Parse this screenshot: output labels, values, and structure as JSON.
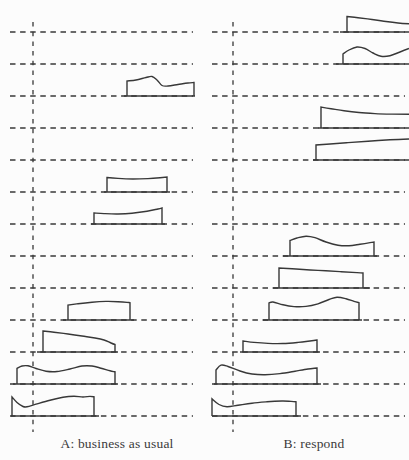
{
  "chart_data": {
    "type": "ridgeline",
    "title": "",
    "layout": {
      "width": 409,
      "height": 460,
      "rows": 13,
      "row_first_y": 32,
      "row_gap": 32,
      "axis_y_top": 22,
      "axis_y_bottom": 432,
      "clip_x": 409,
      "h_dash": "5.5 4.6",
      "v_dash": "4.5 5.2",
      "stroke_width": 1.4
    },
    "colors": {
      "stroke": "#383838",
      "text": "#3a3a3a",
      "background": "#fcfcfc"
    },
    "panels": [
      {
        "id": "A",
        "label": "A: business as usual",
        "x_range": [
          10,
          193
        ],
        "axis_x": 33,
        "shapes": [
          {
            "row": 3,
            "clipped": false,
            "tails": [
              124,
              195
            ],
            "pts": [
              [
                127,
                15
              ],
              [
                136,
                16
              ],
              [
                146,
                18.5
              ],
              [
                152,
                19.5
              ],
              [
                157,
                16
              ],
              [
                162,
                10.5
              ],
              [
                168,
                10
              ],
              [
                178,
                11.5
              ],
              [
                188,
                13
              ],
              [
                194,
                13.5
              ]
            ]
          },
          {
            "row": 6,
            "clipped": false,
            "tails": [
              104,
              170
            ],
            "pts": [
              [
                107,
                14.5
              ],
              [
                118,
                13.6
              ],
              [
                133,
                13
              ],
              [
                148,
                13.4
              ],
              [
                160,
                14.3
              ],
              [
                167,
                15
              ]
            ]
          },
          {
            "row": 7,
            "clipped": false,
            "tails": [
              91,
              165
            ],
            "pts": [
              [
                94,
                11
              ],
              [
                104,
                10.4
              ],
              [
                118,
                10
              ],
              [
                132,
                10.8
              ],
              [
                147,
                12.8
              ],
              [
                158,
                15
              ],
              [
                162,
                16
              ]
            ]
          },
          {
            "row": 10,
            "clipped": false,
            "tails": [
              63,
              134
            ],
            "pts": [
              [
                68,
                15
              ],
              [
                78,
                16.3
              ],
              [
                92,
                17.8
              ],
              [
                106,
                18.6
              ],
              [
                118,
                18.3
              ],
              [
                127,
                17.6
              ],
              [
                130,
                17.3
              ]
            ]
          },
          {
            "row": 11,
            "clipped": false,
            "tails": [
              37,
              118
            ],
            "pts": [
              [
                43,
                21
              ],
              [
                54,
                19.8
              ],
              [
                68,
                18
              ],
              [
                82,
                16
              ],
              [
                95,
                14
              ],
              [
                104,
                12
              ],
              [
                111,
                9
              ],
              [
                115,
                7.5
              ]
            ]
          },
          {
            "row": 12,
            "clipped": false,
            "tails": [
              13,
              118
            ],
            "pts": [
              [
                17,
                15.5
              ],
              [
                22,
                18
              ],
              [
                28,
                18.2
              ],
              [
                36,
                15.5
              ],
              [
                46,
                12.8
              ],
              [
                57,
                12.5
              ],
              [
                70,
                15
              ],
              [
                82,
                18
              ],
              [
                92,
                18
              ],
              [
                101,
                15.8
              ],
              [
                110,
                13.2
              ],
              [
                115,
                12.2
              ]
            ]
          },
          {
            "row": 13,
            "clipped": false,
            "tails": [
              11,
              99
            ],
            "pts": [
              [
                12,
                19
              ],
              [
                17,
                13.5
              ],
              [
                23,
                9.5
              ],
              [
                27,
                9.2
              ],
              [
                36,
                11.8
              ],
              [
                50,
                15.8
              ],
              [
                63,
                18.8
              ],
              [
                74,
                19.8
              ],
              [
                83,
                19
              ],
              [
                90,
                19.6
              ],
              [
                94,
                19.2
              ]
            ]
          }
        ]
      },
      {
        "id": "B",
        "label": "B: respond",
        "x_range": [
          212,
          405
        ],
        "axis_x": 233,
        "shapes": [
          {
            "row": 1,
            "clipped": true,
            "tails": [
              340,
              409
            ],
            "pts": [
              [
                347,
                15.5
              ],
              [
                358,
                14.3
              ],
              [
                372,
                12.5
              ],
              [
                386,
                10.5
              ],
              [
                398,
                9
              ],
              [
                409,
                8.2
              ]
            ]
          },
          {
            "row": 2,
            "clipped": true,
            "tails": [
              336,
              409
            ],
            "pts": [
              [
                343,
                10
              ],
              [
                349,
                14
              ],
              [
                357,
                17
              ],
              [
                365,
                15.5
              ],
              [
                373,
                11
              ],
              [
                381,
                7.8
              ],
              [
                390,
                8.3
              ],
              [
                400,
                12
              ],
              [
                409,
                15.5
              ]
            ]
          },
          {
            "row": 4,
            "clipped": true,
            "tails": [
              318,
              409
            ],
            "pts": [
              [
                321,
                21
              ],
              [
                331,
                19.3
              ],
              [
                344,
                17.2
              ],
              [
                359,
                15.5
              ],
              [
                375,
                14.4
              ],
              [
                392,
                13.9
              ],
              [
                409,
                13.8
              ]
            ]
          },
          {
            "row": 5,
            "clipped": true,
            "tails": [
              313,
              409
            ],
            "pts": [
              [
                316,
                15
              ],
              [
                330,
                16
              ],
              [
                348,
                17.4
              ],
              [
                368,
                18.8
              ],
              [
                390,
                20.2
              ],
              [
                409,
                21
              ]
            ]
          },
          {
            "row": 8,
            "clipped": false,
            "tails": [
              283,
              377
            ],
            "pts": [
              [
                290,
                15.5
              ],
              [
                297,
                18
              ],
              [
                306,
                19.8
              ],
              [
                315,
                18.3
              ],
              [
                326,
                14
              ],
              [
                338,
                10.8
              ],
              [
                349,
                10.3
              ],
              [
                360,
                11.8
              ],
              [
                370,
                13.4
              ],
              [
                374,
                14
              ]
            ]
          },
          {
            "row": 9,
            "clipped": false,
            "tails": [
              273,
              370
            ],
            "pts": [
              [
                279,
                20
              ],
              [
                296,
                19
              ],
              [
                318,
                17.6
              ],
              [
                340,
                16.4
              ],
              [
                357,
                15.4
              ],
              [
                363,
                15
              ]
            ]
          },
          {
            "row": 10,
            "clipped": false,
            "tails": [
              263,
              362
            ],
            "pts": [
              [
                269,
                17
              ],
              [
                273,
                18
              ],
              [
                283,
                15.2
              ],
              [
                294,
                13.4
              ],
              [
                306,
                13.6
              ],
              [
                318,
                16.2
              ],
              [
                329,
                20.5
              ],
              [
                337,
                22.8
              ],
              [
                346,
                21.3
              ],
              [
                354,
                18.6
              ],
              [
                359,
                17.3
              ]
            ]
          },
          {
            "row": 11,
            "clipped": false,
            "tails": [
              240,
              320
            ],
            "pts": [
              [
                243,
                11
              ],
              [
                254,
                9.6
              ],
              [
                268,
                8.6
              ],
              [
                283,
                8.5
              ],
              [
                298,
                9.6
              ],
              [
                310,
                11
              ],
              [
                317,
                12
              ]
            ]
          },
          {
            "row": 12,
            "clipped": false,
            "tails": [
              214,
              321
            ],
            "pts": [
              [
                216,
                14
              ],
              [
                221,
                18.8
              ],
              [
                228,
                17.5
              ],
              [
                240,
                13
              ],
              [
                252,
                10
              ],
              [
                265,
                9.2
              ],
              [
                280,
                10.4
              ],
              [
                295,
                12.8
              ],
              [
                308,
                15
              ],
              [
                317,
                16
              ]
            ]
          },
          {
            "row": 13,
            "clipped": false,
            "tails": [
              212,
              301
            ],
            "pts": [
              [
                212,
                17.2
              ],
              [
                219,
                11.5
              ],
              [
                227,
                9.3
              ],
              [
                238,
                10.8
              ],
              [
                252,
                12.8
              ],
              [
                267,
                14.2
              ],
              [
                282,
                15
              ],
              [
                291,
                14.6
              ],
              [
                296,
                14.2
              ]
            ]
          }
        ]
      }
    ]
  }
}
